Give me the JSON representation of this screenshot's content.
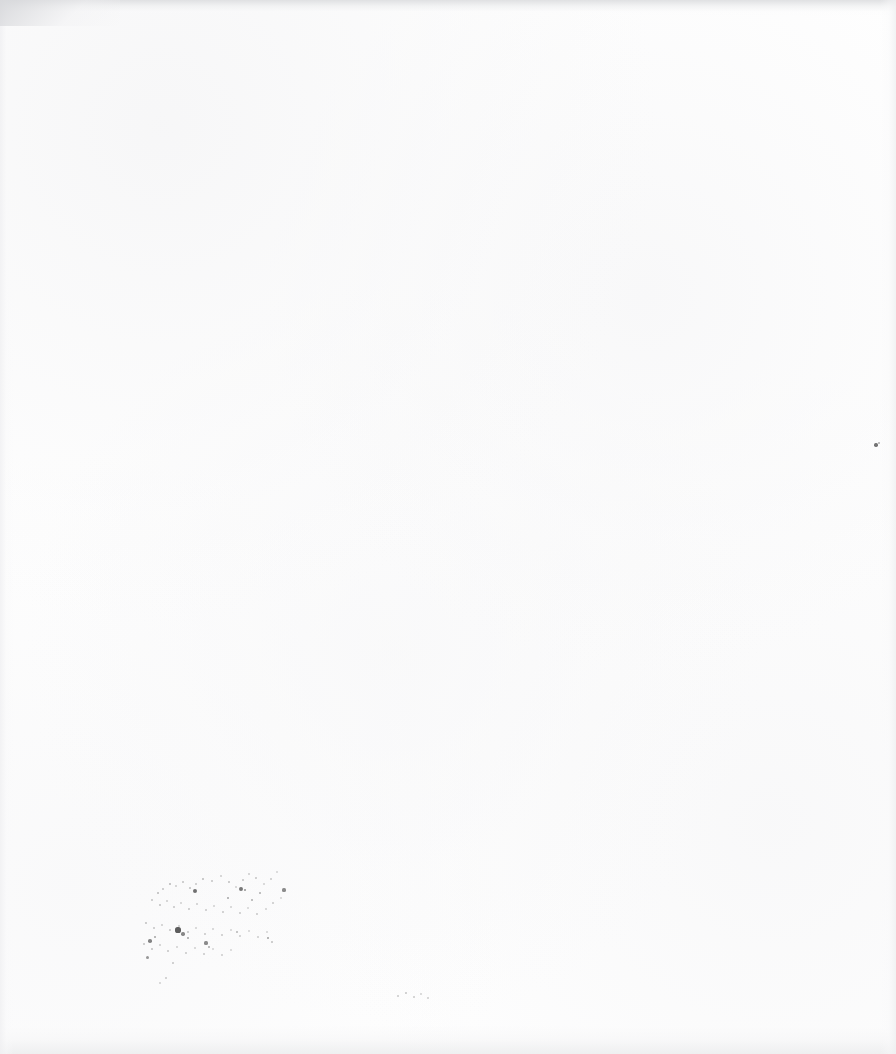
{
  "page": {
    "kind": "scanned-paper-page",
    "width_px": 896,
    "height_px": 1054,
    "paper_color": "#fefefe",
    "background_color": "#ffffff",
    "ink_color": "#3a3a3a",
    "visible_text": "",
    "text_content_count": 0
  },
  "edges": {
    "top": {
      "name": "top-edge-shadow",
      "color": "#dedfe1",
      "height_px": 16
    },
    "bottom": {
      "name": "bottom-edge-shadow",
      "color": "#ecedee",
      "height_px": 40
    },
    "left": {
      "name": "left-edge-shadow",
      "color": "#f0f0f2",
      "width_px": 14
    },
    "right": {
      "name": "right-edge-shadow",
      "color": "#eff0f1",
      "width_px": 16
    },
    "top_left_corner": {
      "name": "top-left-corner-shadow",
      "color": "#d6d7da"
    }
  },
  "artifacts": {
    "label": "scanner dust and ink specks",
    "clusters": [
      {
        "name": "lower-left-speckle-cluster",
        "x": 135,
        "y": 868,
        "width": 150,
        "height": 105,
        "density": "sparse"
      },
      {
        "name": "bottom-center-smudge",
        "x": 392,
        "y": 990,
        "width": 40,
        "height": 14,
        "density": "faint"
      },
      {
        "name": "right-margin-speck",
        "x": 876,
        "y": 445,
        "width": 4,
        "height": 4,
        "density": "single"
      }
    ],
    "specks": [
      {
        "x": 158,
        "y": 893,
        "r": 0.8,
        "o": 0.3
      },
      {
        "x": 163,
        "y": 889,
        "r": 0.7,
        "o": 0.26
      },
      {
        "x": 170,
        "y": 884,
        "r": 0.9,
        "o": 0.34
      },
      {
        "x": 176,
        "y": 886,
        "r": 0.7,
        "o": 0.22
      },
      {
        "x": 183,
        "y": 882,
        "r": 1.0,
        "o": 0.3
      },
      {
        "x": 190,
        "y": 888,
        "r": 0.8,
        "o": 0.28
      },
      {
        "x": 196,
        "y": 884,
        "r": 0.7,
        "o": 0.24
      },
      {
        "x": 203,
        "y": 879,
        "r": 0.9,
        "o": 0.32
      },
      {
        "x": 212,
        "y": 881,
        "r": 0.8,
        "o": 0.26
      },
      {
        "x": 221,
        "y": 876,
        "r": 0.7,
        "o": 0.22
      },
      {
        "x": 229,
        "y": 882,
        "r": 0.9,
        "o": 0.3
      },
      {
        "x": 236,
        "y": 887,
        "r": 0.7,
        "o": 0.2
      },
      {
        "x": 243,
        "y": 880,
        "r": 0.8,
        "o": 0.26
      },
      {
        "x": 249,
        "y": 874,
        "r": 0.7,
        "o": 0.22
      },
      {
        "x": 256,
        "y": 878,
        "r": 0.9,
        "o": 0.28
      },
      {
        "x": 264,
        "y": 884,
        "r": 0.7,
        "o": 0.2
      },
      {
        "x": 271,
        "y": 879,
        "r": 0.8,
        "o": 0.24
      },
      {
        "x": 277,
        "y": 872,
        "r": 0.7,
        "o": 0.18
      },
      {
        "x": 195,
        "y": 891,
        "r": 2.1,
        "o": 0.72
      },
      {
        "x": 241,
        "y": 889,
        "r": 1.9,
        "o": 0.68
      },
      {
        "x": 245,
        "y": 890,
        "r": 1.4,
        "o": 0.55
      },
      {
        "x": 284,
        "y": 890,
        "r": 1.6,
        "o": 0.58
      },
      {
        "x": 260,
        "y": 893,
        "r": 1.1,
        "o": 0.4
      },
      {
        "x": 152,
        "y": 900,
        "r": 0.8,
        "o": 0.26
      },
      {
        "x": 160,
        "y": 905,
        "r": 0.9,
        "o": 0.3
      },
      {
        "x": 167,
        "y": 901,
        "r": 0.7,
        "o": 0.22
      },
      {
        "x": 174,
        "y": 907,
        "r": 0.8,
        "o": 0.26
      },
      {
        "x": 181,
        "y": 903,
        "r": 0.7,
        "o": 0.2
      },
      {
        "x": 189,
        "y": 909,
        "r": 0.9,
        "o": 0.28
      },
      {
        "x": 197,
        "y": 904,
        "r": 0.7,
        "o": 0.22
      },
      {
        "x": 206,
        "y": 910,
        "r": 0.8,
        "o": 0.24
      },
      {
        "x": 214,
        "y": 906,
        "r": 0.7,
        "o": 0.2
      },
      {
        "x": 223,
        "y": 912,
        "r": 0.9,
        "o": 0.26
      },
      {
        "x": 231,
        "y": 907,
        "r": 0.7,
        "o": 0.2
      },
      {
        "x": 240,
        "y": 913,
        "r": 0.8,
        "o": 0.24
      },
      {
        "x": 248,
        "y": 908,
        "r": 0.7,
        "o": 0.18
      },
      {
        "x": 257,
        "y": 914,
        "r": 0.9,
        "o": 0.26
      },
      {
        "x": 266,
        "y": 909,
        "r": 0.7,
        "o": 0.2
      },
      {
        "x": 273,
        "y": 903,
        "r": 0.8,
        "o": 0.24
      },
      {
        "x": 281,
        "y": 898,
        "r": 0.7,
        "o": 0.18
      },
      {
        "x": 228,
        "y": 898,
        "r": 1.3,
        "o": 0.44
      },
      {
        "x": 252,
        "y": 900,
        "r": 1.2,
        "o": 0.4
      },
      {
        "x": 146,
        "y": 923,
        "r": 0.9,
        "o": 0.3
      },
      {
        "x": 154,
        "y": 928,
        "r": 0.8,
        "o": 0.26
      },
      {
        "x": 162,
        "y": 925,
        "r": 0.7,
        "o": 0.22
      },
      {
        "x": 170,
        "y": 930,
        "r": 0.9,
        "o": 0.28
      },
      {
        "x": 179,
        "y": 926,
        "r": 0.7,
        "o": 0.22
      },
      {
        "x": 188,
        "y": 932,
        "r": 0.8,
        "o": 0.26
      },
      {
        "x": 196,
        "y": 928,
        "r": 0.7,
        "o": 0.2
      },
      {
        "x": 205,
        "y": 934,
        "r": 0.9,
        "o": 0.26
      },
      {
        "x": 213,
        "y": 929,
        "r": 0.7,
        "o": 0.2
      },
      {
        "x": 222,
        "y": 935,
        "r": 0.8,
        "o": 0.24
      },
      {
        "x": 231,
        "y": 930,
        "r": 0.7,
        "o": 0.18
      },
      {
        "x": 240,
        "y": 936,
        "r": 0.9,
        "o": 0.24
      },
      {
        "x": 249,
        "y": 931,
        "r": 0.7,
        "o": 0.18
      },
      {
        "x": 258,
        "y": 937,
        "r": 0.8,
        "o": 0.22
      },
      {
        "x": 267,
        "y": 932,
        "r": 0.7,
        "o": 0.18
      },
      {
        "x": 178,
        "y": 930,
        "r": 2.6,
        "o": 0.82
      },
      {
        "x": 183,
        "y": 934,
        "r": 1.7,
        "o": 0.6
      },
      {
        "x": 188,
        "y": 938,
        "r": 1.2,
        "o": 0.44
      },
      {
        "x": 206,
        "y": 943,
        "r": 1.6,
        "o": 0.58
      },
      {
        "x": 209,
        "y": 947,
        "r": 1.2,
        "o": 0.42
      },
      {
        "x": 237,
        "y": 932,
        "r": 1.1,
        "o": 0.36
      },
      {
        "x": 144,
        "y": 944,
        "r": 0.8,
        "o": 0.26
      },
      {
        "x": 152,
        "y": 949,
        "r": 0.9,
        "o": 0.3
      },
      {
        "x": 160,
        "y": 945,
        "r": 0.7,
        "o": 0.22
      },
      {
        "x": 168,
        "y": 951,
        "r": 0.8,
        "o": 0.26
      },
      {
        "x": 177,
        "y": 947,
        "r": 0.7,
        "o": 0.2
      },
      {
        "x": 186,
        "y": 953,
        "r": 0.9,
        "o": 0.26
      },
      {
        "x": 195,
        "y": 948,
        "r": 0.7,
        "o": 0.2
      },
      {
        "x": 204,
        "y": 954,
        "r": 0.8,
        "o": 0.24
      },
      {
        "x": 213,
        "y": 949,
        "r": 0.7,
        "o": 0.18
      },
      {
        "x": 222,
        "y": 955,
        "r": 0.8,
        "o": 0.22
      },
      {
        "x": 231,
        "y": 950,
        "r": 0.7,
        "o": 0.18
      },
      {
        "x": 150,
        "y": 941,
        "r": 1.8,
        "o": 0.62
      },
      {
        "x": 155,
        "y": 937,
        "r": 1.3,
        "o": 0.46
      },
      {
        "x": 147,
        "y": 957,
        "r": 1.5,
        "o": 0.52
      },
      {
        "x": 173,
        "y": 963,
        "r": 0.9,
        "o": 0.28
      },
      {
        "x": 166,
        "y": 978,
        "r": 0.8,
        "o": 0.24
      },
      {
        "x": 160,
        "y": 983,
        "r": 0.7,
        "o": 0.2
      },
      {
        "x": 268,
        "y": 938,
        "r": 1.4,
        "o": 0.48
      },
      {
        "x": 272,
        "y": 942,
        "r": 0.9,
        "o": 0.3
      },
      {
        "x": 876,
        "y": 445,
        "r": 1.7,
        "o": 0.7
      },
      {
        "x": 879,
        "y": 443,
        "r": 1.0,
        "o": 0.4
      },
      {
        "x": 398,
        "y": 996,
        "r": 0.8,
        "o": 0.24
      },
      {
        "x": 406,
        "y": 993,
        "r": 0.9,
        "o": 0.28
      },
      {
        "x": 414,
        "y": 997,
        "r": 0.8,
        "o": 0.24
      },
      {
        "x": 421,
        "y": 994,
        "r": 0.7,
        "o": 0.2
      },
      {
        "x": 428,
        "y": 998,
        "r": 0.8,
        "o": 0.22
      }
    ]
  }
}
